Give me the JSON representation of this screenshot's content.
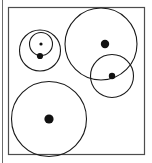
{
  "figure": {
    "canvas": {
      "width": 152,
      "height": 163,
      "background": "#ffffff"
    },
    "stroke_color": "#1a1a1a",
    "dot_color": "#111111",
    "frame_color": "#4d4d4d",
    "margin_rule_color": "#6b6b6b",
    "frame": {
      "x": 8.5,
      "y": 7.5,
      "width": 136,
      "height": 147,
      "stroke_width": 1.2
    },
    "margin_rule": {
      "x": 2.5,
      "y1": 0,
      "y2": 163
    },
    "circles": [
      {
        "name": "top-left-outer-circle",
        "cx": 40,
        "cy": 50.5,
        "r": 20.5,
        "stroke_width": 1.1
      },
      {
        "name": "top-left-inner-circle",
        "cx": 41,
        "cy": 44,
        "r": 11.5,
        "stroke_width": 1.1
      },
      {
        "name": "top-right-large-circle",
        "cx": 101,
        "cy": 44,
        "r": 36,
        "stroke_width": 1.1
      },
      {
        "name": "right-medium-circle",
        "cx": 112,
        "cy": 76,
        "r": 21.5,
        "stroke_width": 1.1
      },
      {
        "name": "bottom-left-large-circle",
        "cx": 49,
        "cy": 119,
        "r": 37.5,
        "stroke_width": 1.1
      }
    ],
    "dots": [
      {
        "name": "top-left-inner-center-dot",
        "cx": 41,
        "cy": 44,
        "r": 1.6
      },
      {
        "name": "top-left-lower-dot",
        "cx": 40,
        "cy": 56,
        "r": 3.1
      },
      {
        "name": "top-right-large-center-dot",
        "cx": 105,
        "cy": 44,
        "r": 4.2
      },
      {
        "name": "right-medium-center-dot",
        "cx": 112,
        "cy": 76,
        "r": 3.2
      },
      {
        "name": "bottom-left-center-dot",
        "cx": 49,
        "cy": 119,
        "r": 4.6
      }
    ]
  },
  "chart_data": {
    "type": "scatter",
    "xlabel": "",
    "ylabel": "",
    "xlim": [
      0,
      152
    ],
    "ylim": [
      0,
      163
    ],
    "grid": false,
    "legend": null,
    "series": [
      {
        "name": "circles",
        "values": [
          {
            "label": "top-left-outer-circle",
            "x": 40,
            "y": 50.5,
            "r": 20.5
          },
          {
            "label": "top-left-inner-circle",
            "x": 41,
            "y": 44,
            "r": 11.5
          },
          {
            "label": "top-right-large-circle",
            "x": 101,
            "y": 44,
            "r": 36
          },
          {
            "label": "right-medium-circle",
            "x": 112,
            "y": 76,
            "r": 21.5
          },
          {
            "label": "bottom-left-large-circle",
            "x": 49,
            "y": 119,
            "r": 37.5
          }
        ]
      },
      {
        "name": "center-points",
        "values": [
          {
            "label": "top-left-inner-center-dot",
            "x": 41,
            "y": 44,
            "r": 1.6
          },
          {
            "label": "top-left-lower-dot",
            "x": 40,
            "y": 56,
            "r": 3.1
          },
          {
            "label": "top-right-large-center-dot",
            "x": 105,
            "y": 44,
            "r": 4.2
          },
          {
            "label": "right-medium-center-dot",
            "x": 112,
            "y": 76,
            "r": 3.2
          },
          {
            "label": "bottom-left-center-dot",
            "x": 49,
            "y": 119,
            "r": 4.6
          }
        ]
      }
    ]
  }
}
